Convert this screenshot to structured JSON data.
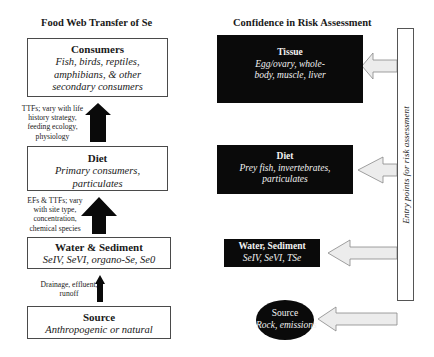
{
  "left_column": {
    "heading": "Food Web Transfer of Se",
    "boxes": [
      {
        "title": "Consumers",
        "subtitle_lines": [
          "Fish, birds, reptiles,",
          "amphibians, & other",
          "secondary consumers"
        ]
      },
      {
        "title": "Diet",
        "subtitle_lines": [
          "Primary consumers,",
          "particulates"
        ]
      },
      {
        "title": "Water & Sediment",
        "subtitle_lines": [
          "SeIV, SeVI, organo-Se, Se0"
        ]
      },
      {
        "title": "Source",
        "subtitle_lines": [
          "Anthropogenic or natural"
        ]
      }
    ],
    "arrow_labels": [
      {
        "lines": [
          "TTFs; vary with life",
          "history strategy,",
          "feeding ecology,",
          "physiology"
        ]
      },
      {
        "lines": [
          "EFs & TTFs; vary",
          "with site type,",
          "concentration,",
          "chemical species"
        ]
      },
      {
        "lines": [
          "Drainage, effluent,",
          "runoff"
        ]
      }
    ]
  },
  "right_column": {
    "heading": "Confidence in Risk Assessment",
    "boxes": [
      {
        "title": "Tissue",
        "subtitle_lines": [
          "Egg/ovary, whole-",
          "body, muscle, liver"
        ]
      },
      {
        "title": "Diet",
        "subtitle_lines": [
          "Prey fish, invertebrates,",
          "particulates"
        ]
      },
      {
        "title": "Water, Sediment",
        "subtitle_lines": [
          "SeIV, SeVI, TSe"
        ]
      },
      {
        "title": "Source",
        "subtitle_lines": [
          "Rock, emissions"
        ]
      }
    ],
    "entry_bar_label": "Entry points for risk assessment"
  },
  "colors": {
    "black_box": "#0a0a0a",
    "arrow_fill": "#ececec",
    "border": "#4a4a4a"
  }
}
